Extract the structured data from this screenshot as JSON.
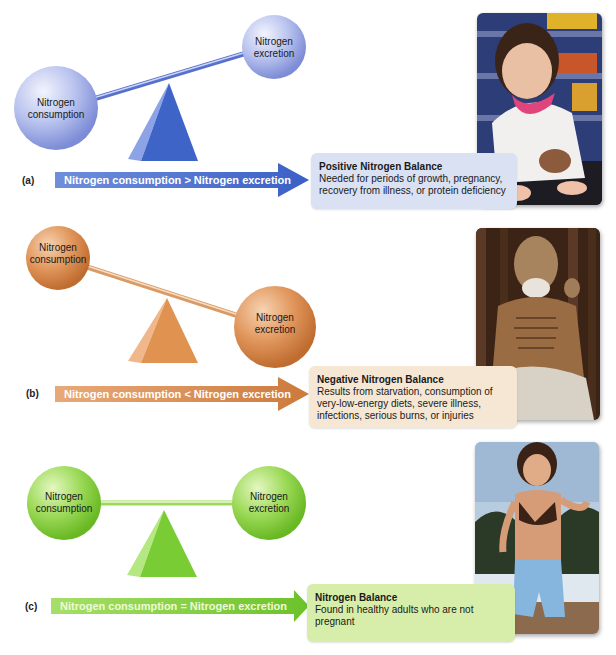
{
  "colors": {
    "blue_light": "#dfe4f7",
    "blue_mid": "#8e9ce0",
    "blue_dark": "#3b5fc4",
    "blue_box": "#d8e0f2",
    "orange_light": "#f4c49c",
    "orange_mid": "#d98a4c",
    "orange_dark": "#b8652a",
    "orange_box": "#f6e8d6",
    "green_light": "#d4f0a0",
    "green_mid": "#8fd445",
    "green_dark": "#62b81e",
    "green_box": "#d6eeaa"
  },
  "panels": [
    {
      "letter": "(a)",
      "left_ball": {
        "line1": "Nitrogen",
        "line2": "consumption"
      },
      "right_ball": {
        "line1": "Nitrogen",
        "line2": "excretion"
      },
      "arrow_label": "Nitrogen consumption > Nitrogen excretion",
      "box_title": "Positive Nitrogen Balance",
      "box_lines": [
        "Needed for periods of growth, pregnancy,",
        "recovery from illness, or protein deficiency"
      ],
      "photo": "baby-crawling-photo"
    },
    {
      "letter": "(b)",
      "left_ball": {
        "line1": "Nitrogen",
        "line2": "consumption"
      },
      "right_ball": {
        "line1": "Nitrogen",
        "line2": "excretion"
      },
      "arrow_label": "Nitrogen consumption < Nitrogen excretion",
      "box_title": "Negative Nitrogen Balance",
      "box_lines": [
        "Results from starvation, consumption of",
        "very-low-energy diets, severe illness,",
        "infections, serious burns, or injuries"
      ],
      "photo": "emaciated-man-photo"
    },
    {
      "letter": "(c)",
      "left_ball": {
        "line1": "Nitrogen",
        "line2": "consumption"
      },
      "right_ball": {
        "line1": "Nitrogen",
        "line2": "excretion"
      },
      "arrow_label": "Nitrogen consumption = Nitrogen excretion",
      "box_title": "Nitrogen Balance",
      "box_lines": [
        "Found in healthy adults who are not",
        "pregnant"
      ],
      "photo": "woman-running-beach-photo"
    }
  ]
}
